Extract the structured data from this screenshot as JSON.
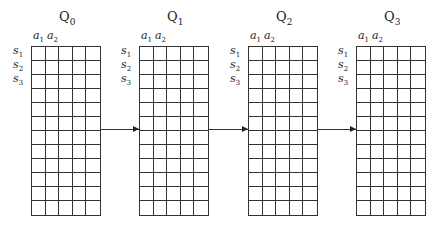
{
  "diagram": {
    "panels": [
      {
        "title": "Q",
        "subscript": "0",
        "grid_left": 31
      },
      {
        "title": "Q",
        "subscript": "1",
        "grid_left": 139
      },
      {
        "title": "Q",
        "subscript": "2",
        "grid_left": 248
      },
      {
        "title": "Q",
        "subscript": "3",
        "grid_left": 356
      }
    ],
    "column_labels": [
      {
        "base": "a",
        "sub": "1"
      },
      {
        "base": "a",
        "sub": "2"
      }
    ],
    "row_labels": [
      {
        "base": "s",
        "sub": "1"
      },
      {
        "base": "s",
        "sub": "2"
      },
      {
        "base": "s",
        "sub": "3"
      }
    ],
    "grid": {
      "columns": 5,
      "rows": 12
    },
    "arrows": [
      {
        "from": "Q0",
        "to": "Q1"
      },
      {
        "from": "Q1",
        "to": "Q2"
      },
      {
        "from": "Q2",
        "to": "Q3"
      }
    ],
    "colors": {
      "line": "#333333",
      "background": "#ffffff",
      "text": "#222222"
    }
  }
}
